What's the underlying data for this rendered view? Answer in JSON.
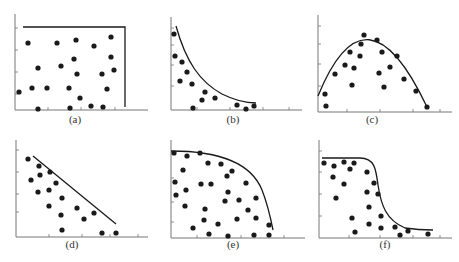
{
  "figure": {
    "width": 459,
    "height": 262,
    "ink_color": "#1a1a1a",
    "axis_color": "#777777"
  },
  "chart_data": [
    {
      "id": "a",
      "label": "(a)",
      "type": "scatter",
      "title": "",
      "xlabel": "",
      "ylabel": "",
      "description": "Random scatter bounded by a rectangular frontier (flat top, vertical right edge)",
      "origin": [
        15,
        110
      ],
      "x_end": 148,
      "y_top": 14,
      "x_ticks": [
        48,
        81,
        115
      ],
      "y_ticks": [
        28,
        50,
        72,
        94
      ],
      "frontier": {
        "kind": "polyline",
        "points": [
          [
            23,
            27
          ],
          [
            125,
            27
          ],
          [
            125,
            107
          ]
        ]
      },
      "points": [
        [
          28,
          43
        ],
        [
          57,
          43
        ],
        [
          76,
          40
        ],
        [
          94,
          46
        ],
        [
          111,
          37
        ],
        [
          38,
          68
        ],
        [
          61,
          66
        ],
        [
          74,
          59
        ],
        [
          111,
          57
        ],
        [
          77,
          74
        ],
        [
          102,
          74
        ],
        [
          114,
          70
        ],
        [
          19,
          92
        ],
        [
          32,
          88
        ],
        [
          47,
          88
        ],
        [
          69,
          88
        ],
        [
          107,
          89
        ],
        [
          80,
          98
        ],
        [
          38,
          109
        ],
        [
          70,
          108
        ],
        [
          91,
          106
        ],
        [
          103,
          107
        ]
      ],
      "label_pos": [
        75,
        123
      ]
    },
    {
      "id": "b",
      "label": "(b)",
      "type": "scatter",
      "title": "",
      "xlabel": "",
      "ylabel": "",
      "description": "Points below a decaying (hyperbolic/exponential) frontier",
      "origin": [
        171,
        110
      ],
      "x_end": 302,
      "y_top": 17,
      "x_ticks": [
        197,
        230,
        263,
        289
      ],
      "y_ticks": [
        28,
        45,
        65,
        86
      ],
      "frontier": {
        "kind": "path",
        "d": "M176,26 C186,62 200,82 222,94 C234,100 244,103 256,103"
      },
      "points": [
        [
          174,
          34
        ],
        [
          175,
          56
        ],
        [
          182,
          62
        ],
        [
          187,
          72
        ],
        [
          180,
          81
        ],
        [
          192,
          84
        ],
        [
          205,
          92
        ],
        [
          202,
          100
        ],
        [
          215,
          98
        ],
        [
          237,
          105
        ],
        [
          254,
          106
        ],
        [
          193,
          108
        ],
        [
          246,
          109
        ]
      ],
      "label_pos": [
        233,
        123
      ]
    },
    {
      "id": "c",
      "label": "(c)",
      "type": "scatter",
      "title": "",
      "xlabel": "",
      "ylabel": "",
      "description": "Points below an inverted parabolic (hump-shaped) frontier",
      "origin": [
        318,
        112
      ],
      "x_end": 452,
      "y_top": 15,
      "x_ticks": [
        347,
        380,
        413,
        440
      ],
      "y_ticks": [
        26,
        44,
        64,
        86
      ],
      "frontier": {
        "kind": "path",
        "d": "M318,96 Q366,-22 427,107"
      },
      "points": [
        [
          364,
          35
        ],
        [
          377,
          40
        ],
        [
          361,
          44
        ],
        [
          350,
          52
        ],
        [
          382,
          52
        ],
        [
          360,
          56
        ],
        [
          397,
          56
        ],
        [
          345,
          65
        ],
        [
          354,
          68
        ],
        [
          390,
          67
        ],
        [
          335,
          74
        ],
        [
          379,
          73
        ],
        [
          404,
          79
        ],
        [
          352,
          85
        ],
        [
          384,
          87
        ],
        [
          325,
          94
        ],
        [
          416,
          91
        ],
        [
          326,
          106
        ],
        [
          427,
          107
        ]
      ],
      "label_pos": [
        372,
        123
      ]
    },
    {
      "id": "d",
      "label": "(d)",
      "type": "scatter",
      "title": "",
      "xlabel": "",
      "ylabel": "",
      "description": "Points below a straight descending (linear) frontier",
      "origin": [
        16,
        237
      ],
      "x_end": 148,
      "y_top": 140,
      "x_ticks": [
        49,
        82,
        110,
        138
      ],
      "y_ticks": [
        150,
        172,
        194,
        212
      ],
      "frontier": {
        "kind": "polyline",
        "points": [
          [
            33,
            156
          ],
          [
            116,
            224
          ]
        ]
      },
      "points": [
        [
          28,
          159
        ],
        [
          39,
          166
        ],
        [
          40,
          175
        ],
        [
          50,
          172
        ],
        [
          31,
          180
        ],
        [
          56,
          183
        ],
        [
          38,
          192
        ],
        [
          49,
          190
        ],
        [
          62,
          198
        ],
        [
          49,
          206
        ],
        [
          77,
          208
        ],
        [
          61,
          215
        ],
        [
          84,
          219
        ],
        [
          94,
          213
        ],
        [
          62,
          230
        ],
        [
          102,
          233
        ],
        [
          116,
          233
        ]
      ],
      "label_pos": [
        72,
        248
      ]
    },
    {
      "id": "e",
      "label": "(e)",
      "type": "scatter",
      "title": "",
      "xlabel": "",
      "ylabel": "",
      "description": "Points below a concave (quarter-ellipse) frontier",
      "origin": [
        171,
        238
      ],
      "x_end": 305,
      "y_top": 140,
      "x_ticks": [
        197,
        241,
        284
      ],
      "y_ticks": [
        152,
        178,
        202,
        222
      ],
      "frontier": {
        "kind": "path",
        "d": "M171,151 C212,151 250,160 262,190 C268,205 271,220 273,230"
      },
      "points": [
        [
          174,
          153
        ],
        [
          187,
          156
        ],
        [
          200,
          153
        ],
        [
          208,
          163
        ],
        [
          221,
          164
        ],
        [
          232,
          171
        ],
        [
          183,
          170
        ],
        [
          175,
          182
        ],
        [
          227,
          176
        ],
        [
          201,
          184
        ],
        [
          211,
          184
        ],
        [
          246,
          183
        ],
        [
          176,
          195
        ],
        [
          186,
          190
        ],
        [
          228,
          192
        ],
        [
          256,
          198
        ],
        [
          239,
          200
        ],
        [
          225,
          201
        ],
        [
          185,
          206
        ],
        [
          205,
          209
        ],
        [
          248,
          210
        ],
        [
          204,
          220
        ],
        [
          218,
          224
        ],
        [
          237,
          219
        ],
        [
          256,
          218
        ],
        [
          193,
          228
        ],
        [
          269,
          225
        ],
        [
          209,
          234
        ],
        [
          228,
          236
        ],
        [
          254,
          235
        ],
        [
          269,
          235
        ]
      ],
      "label_pos": [
        233,
        248
      ]
    },
    {
      "id": "f",
      "label": "(f)",
      "type": "scatter",
      "title": "",
      "xlabel": "",
      "ylabel": "",
      "description": "Points below a reverse-sigmoid (S-shaped, step-down) frontier",
      "origin": [
        319,
        238
      ],
      "x_end": 452,
      "y_top": 140,
      "x_ticks": [
        349,
        380,
        413,
        440
      ],
      "y_ticks": [
        151,
        172,
        194,
        216
      ],
      "frontier": {
        "kind": "path",
        "d": "M322,158 L360,158 C375,158 376,170 378,185 C381,205 386,220 405,228 C418,230 425,230 433,230"
      },
      "points": [
        [
          324,
          163
        ],
        [
          334,
          166
        ],
        [
          344,
          162
        ],
        [
          354,
          163
        ],
        [
          350,
          169
        ],
        [
          367,
          172
        ],
        [
          333,
          177
        ],
        [
          344,
          184
        ],
        [
          374,
          183
        ],
        [
          367,
          192
        ],
        [
          378,
          194
        ],
        [
          336,
          198
        ],
        [
          369,
          207
        ],
        [
          352,
          218
        ],
        [
          381,
          216
        ],
        [
          369,
          224
        ],
        [
          395,
          227
        ],
        [
          381,
          228
        ],
        [
          408,
          231
        ],
        [
          355,
          232
        ],
        [
          400,
          235
        ],
        [
          428,
          234
        ]
      ],
      "label_pos": [
        385,
        248
      ]
    }
  ]
}
